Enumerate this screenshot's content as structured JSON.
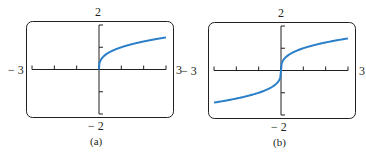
{
  "chart_data": [
    {
      "type": "line",
      "title": "",
      "caption": "(a)",
      "xlim": [
        -3,
        3
      ],
      "ylim": [
        -2,
        2
      ],
      "xtick_labels": {
        "min": "− 3",
        "max": "3"
      },
      "ytick_labels": {
        "min": "− 2",
        "max": "2"
      },
      "xticks": [
        -3,
        -2,
        -1,
        0,
        1,
        2,
        3
      ],
      "yticks": [
        -2,
        -1,
        0,
        1,
        2
      ],
      "grid": false,
      "series": [
        {
          "name": "curve",
          "color": "#2a7fc8",
          "x": [
            0,
            0.05,
            0.25,
            0.5,
            1,
            1.5,
            2,
            2.5,
            3
          ],
          "y": [
            0,
            0.37,
            0.63,
            0.79,
            1.0,
            1.14,
            1.26,
            1.36,
            1.44
          ]
        }
      ]
    },
    {
      "type": "line",
      "title": "",
      "caption": "(b)",
      "xlim": [
        -3,
        3
      ],
      "ylim": [
        -2,
        2
      ],
      "xtick_labels": {
        "min": "− 3",
        "max": "3"
      },
      "ytick_labels": {
        "min": "− 2",
        "max": "2"
      },
      "xticks": [
        -3,
        -2,
        -1,
        0,
        1,
        2,
        3
      ],
      "yticks": [
        -2,
        -1,
        0,
        1,
        2
      ],
      "grid": false,
      "series": [
        {
          "name": "curve",
          "color": "#2a7fc8",
          "x": [
            -3,
            -2,
            -1,
            -0.5,
            -0.1,
            0,
            0.1,
            0.5,
            1,
            2,
            3
          ],
          "y": [
            -1.44,
            -1.26,
            -1.0,
            -0.79,
            -0.46,
            0,
            0.46,
            0.79,
            1.0,
            1.26,
            1.44
          ]
        }
      ]
    }
  ]
}
